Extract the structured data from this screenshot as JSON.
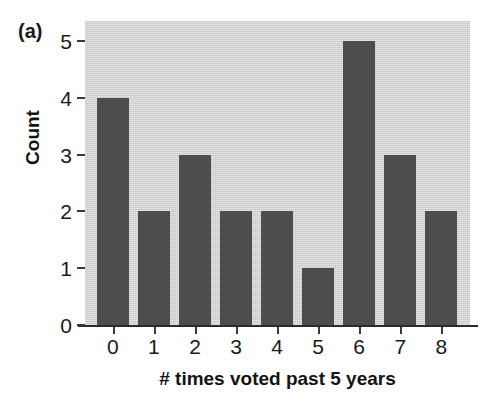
{
  "figure": {
    "panel_label": "(a)",
    "background_color": "#ffffff",
    "plot_background_color": "#d3d3d3",
    "bar_color": "#4d4d4d",
    "axis_color": "#2b2b2b"
  },
  "chart_data": {
    "type": "bar",
    "title": "",
    "subtitle": "",
    "xlabel": "# times voted past 5 years",
    "ylabel": "Count",
    "categories": [
      "0",
      "1",
      "2",
      "3",
      "4",
      "5",
      "6",
      "7",
      "8"
    ],
    "values": [
      4,
      2,
      3,
      2,
      2,
      1,
      5,
      3,
      2
    ],
    "xtick_labels": [
      "0",
      "1",
      "2",
      "3",
      "4",
      "5",
      "6",
      "7",
      "8"
    ],
    "ytick_labels": [
      "0",
      "1",
      "2",
      "3",
      "4",
      "5"
    ],
    "ytick_values": [
      0,
      1,
      2,
      3,
      4,
      5
    ],
    "ylim": [
      0,
      5.35
    ],
    "xlim": [
      -0.68,
      8.7
    ],
    "grid": false,
    "legend": null,
    "legend_position": "none",
    "annotations": [
      "(a)"
    ],
    "series": [
      {
        "name": "Count",
        "color": "#4d4d4d",
        "values": [
          4,
          2,
          3,
          2,
          2,
          1,
          5,
          3,
          2
        ]
      }
    ]
  }
}
